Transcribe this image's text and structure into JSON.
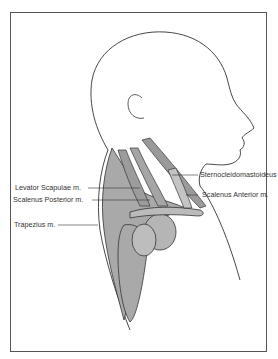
{
  "figure": {
    "colors": {
      "muscle_fill": "#a9a9a9",
      "outline": "#333333",
      "background": "#ffffff"
    },
    "labels": [
      {
        "id": "levator-scapulae",
        "text": "Levator Scapulae m."
      },
      {
        "id": "scalenus-posterior",
        "text": "Scalenus Posterior m."
      },
      {
        "id": "trapezius",
        "text": "Trapezius m."
      },
      {
        "id": "sternocleidomastoideus",
        "text": "Sternocleidomastoideus m."
      },
      {
        "id": "scalenus-anterior",
        "text": "Scalenus Anterior m."
      }
    ]
  }
}
